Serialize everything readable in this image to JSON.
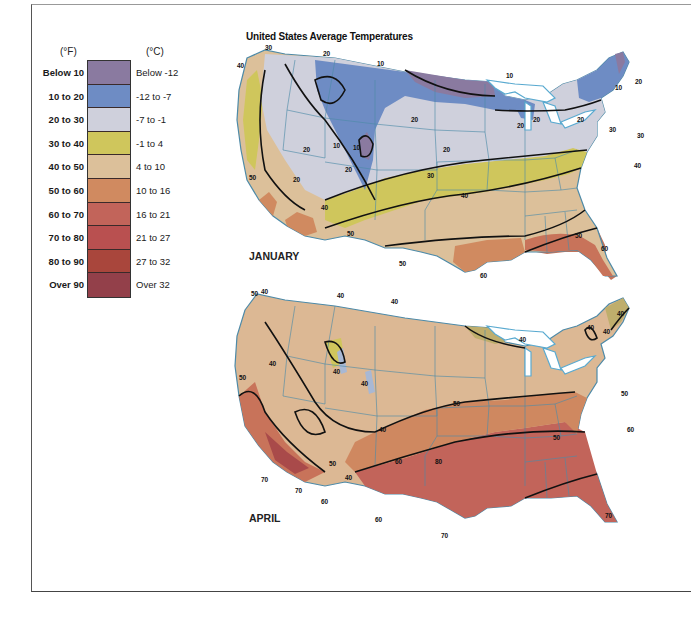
{
  "title": "United States Average Temperatures",
  "legend": {
    "unit_f": "(°F)",
    "unit_c": "(°C)",
    "items": [
      {
        "f": "Below 10",
        "c": "Below -12",
        "color": "#8a7aa0"
      },
      {
        "f": "10 to 20",
        "c": "-12 to -7",
        "color": "#6e8cc4"
      },
      {
        "f": "20 to 30",
        "c": "-7 to -1",
        "color": "#cfd0dc"
      },
      {
        "f": "30 to 40",
        "c": "-1 to  4",
        "color": "#cfc65c"
      },
      {
        "f": "40 to 50",
        "c": "4 to 10",
        "color": "#dcc09a"
      },
      {
        "f": "50 to 60",
        "c": "10 to 16",
        "color": "#d08a60"
      },
      {
        "f": "60 to 70",
        "c": "16 to 21",
        "color": "#c2645a"
      },
      {
        "f": "70 to 80",
        "c": "21 to 27",
        "color": "#b95050"
      },
      {
        "f": "80 to 90",
        "c": "27 to 32",
        "color": "#a9463c"
      },
      {
        "f": "Over 90",
        "c": "Over 32",
        "color": "#93404a"
      }
    ]
  },
  "maps": [
    {
      "month": "JANUARY",
      "isotherm_labels": [
        "30",
        "20",
        "10",
        "40",
        "10",
        "20",
        "20",
        "20",
        "20",
        "10",
        "20",
        "30",
        "20",
        "20",
        "20",
        "10",
        "20",
        "30",
        "40",
        "50",
        "40",
        "40",
        "50",
        "50",
        "60",
        "60",
        "50"
      ]
    },
    {
      "month": "APRIL",
      "isotherm_labels": [
        "40",
        "50",
        "40",
        "40",
        "40",
        "50",
        "40",
        "40",
        "50",
        "40",
        "40",
        "50",
        "60",
        "50",
        "60",
        "50",
        "40",
        "60",
        "70",
        "80",
        "60",
        "70",
        "70",
        "60"
      ]
    }
  ]
}
